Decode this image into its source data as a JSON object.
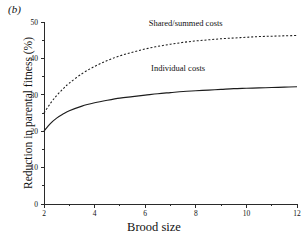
{
  "figure": {
    "panel_label": "(b)",
    "xlabel": "Brood size",
    "ylabel": "Reduction in parental fitness (%)"
  },
  "chart_data": {
    "type": "line",
    "title": "",
    "panel": "(b)",
    "xlabel": "Brood size",
    "ylabel": "Reduction in parental fitness (%)",
    "xlim": [
      2,
      12
    ],
    "ylim": [
      0,
      50
    ],
    "xticks": [
      2,
      4,
      6,
      8,
      10,
      12
    ],
    "xtick_labels": [
      "2",
      "4",
      "6",
      "8",
      "10",
      "12"
    ],
    "xminor_ticks": [
      3,
      5,
      7,
      9,
      11
    ],
    "yticks": [
      0,
      10,
      20,
      30,
      40,
      50
    ],
    "ytick_labels": [
      "0",
      "10",
      "20",
      "30",
      "40",
      "50"
    ],
    "yminor_ticks": [
      5,
      15,
      25,
      35,
      45
    ],
    "grid": false,
    "legend": "inline-annotations",
    "series": [
      {
        "name": "Shared/summed costs",
        "style": "dashed",
        "label_x": 7.6,
        "label_y": 49.0,
        "x": [
          2,
          2.25,
          2.5,
          2.75,
          3,
          3.5,
          4,
          4.5,
          5,
          5.5,
          6,
          6.5,
          7,
          7.5,
          8,
          8.5,
          9,
          9.5,
          10,
          10.5,
          11,
          11.5,
          12
        ],
        "values": [
          25.0,
          27.6,
          29.8,
          31.6,
          33.2,
          35.8,
          37.8,
          39.4,
          40.7,
          41.7,
          42.6,
          43.3,
          43.9,
          44.4,
          44.8,
          45.1,
          45.4,
          45.6,
          45.8,
          46.0,
          46.1,
          46.2,
          46.3
        ]
      },
      {
        "name": "Individual costs",
        "style": "solid",
        "label_x": 7.3,
        "label_y": 36.5,
        "x": [
          2,
          2.25,
          2.5,
          2.75,
          3,
          3.5,
          4,
          4.5,
          5,
          5.5,
          6,
          6.5,
          7,
          7.5,
          8,
          8.5,
          9,
          9.5,
          10,
          10.5,
          11,
          11.5,
          12
        ],
        "values": [
          20.0,
          22.1,
          23.6,
          24.7,
          25.6,
          26.9,
          27.8,
          28.5,
          29.1,
          29.5,
          29.9,
          30.3,
          30.6,
          30.9,
          31.1,
          31.3,
          31.5,
          31.7,
          31.8,
          31.9,
          32.0,
          32.1,
          32.2
        ]
      }
    ]
  },
  "colors": {
    "axis": "#2a2a2a",
    "curve": "#1c1c1c",
    "background": "#ffffff"
  }
}
